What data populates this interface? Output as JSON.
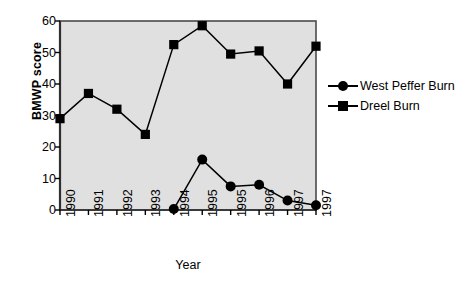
{
  "chart_data": {
    "type": "line",
    "title": "",
    "xlabel": "Year",
    "ylabel": "BMWP score",
    "categories": [
      "1990",
      "1991",
      "1992",
      "1993",
      "1994",
      "1995",
      "1995",
      "1996",
      "1997",
      "1997"
    ],
    "xtick_labels": [
      "1990",
      "1991",
      "1992",
      "1993",
      "1994",
      "1995",
      "1995",
      "1996",
      "1997",
      "1997"
    ],
    "ytick_labels": [
      "0",
      "10",
      "20",
      "30",
      "40",
      "50",
      "60"
    ],
    "ytick_values": [
      0,
      10,
      20,
      30,
      40,
      50,
      60
    ],
    "ylim": [
      0,
      60
    ],
    "grid": false,
    "legend_position": "right",
    "plot_background": "#e0e0e0",
    "line_color": "#000000",
    "series": [
      {
        "name": "West Peffer Burn",
        "marker": "circle",
        "color": "#000000",
        "x": [
          "1994",
          "1995",
          "1995",
          "1996",
          "1997",
          "1997"
        ],
        "x_index": [
          4,
          5,
          6,
          7,
          8,
          9
        ],
        "values": [
          0.3,
          16,
          7.5,
          8,
          3,
          1.5
        ]
      },
      {
        "name": "Dreel Burn",
        "marker": "square",
        "color": "#000000",
        "x": [
          "1990",
          "1991",
          "1992",
          "1993",
          "1994",
          "1995",
          "1995",
          "1996",
          "1997",
          "1997"
        ],
        "x_index": [
          0,
          1,
          2,
          3,
          4,
          5,
          6,
          7,
          8,
          9
        ],
        "values": [
          29,
          37,
          32,
          24,
          52.5,
          58.5,
          49.5,
          50.5,
          40,
          52
        ]
      }
    ]
  },
  "legend": {
    "items": [
      {
        "label": "West Peffer Burn",
        "marker": "circle"
      },
      {
        "label": "Dreel Burn",
        "marker": "square"
      }
    ]
  }
}
